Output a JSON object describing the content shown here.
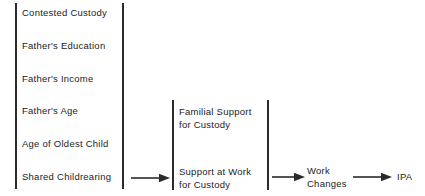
{
  "diagram": {
    "type": "flow-diagram",
    "line_color": "#2b2b2b",
    "text_color": "#1b1b1b",
    "background": "#ffffff",
    "columns": [
      {
        "id": "predictors",
        "name": "predictor-variables-bracket",
        "bracket": {
          "left_x": 15,
          "right_x": 122,
          "top_y": 3,
          "bottom_y": 189
        },
        "items": [
          {
            "label": "Contested Custody",
            "x": 22,
            "y": 7
          },
          {
            "label": "Father's Education",
            "x": 22,
            "y": 40
          },
          {
            "label": "Father's Income",
            "x": 22,
            "y": 73
          },
          {
            "label": "Father's Age",
            "x": 22,
            "y": 105
          },
          {
            "label": "Age of Oldest Child",
            "x": 22,
            "y": 138
          },
          {
            "label": "Shared Childrearing",
            "x": 22,
            "y": 171
          }
        ]
      },
      {
        "id": "support",
        "name": "support-variables-bracket",
        "bracket": {
          "left_x": 172,
          "right_x": 267,
          "top_y": 100,
          "bottom_y": 190
        },
        "items": [
          {
            "lines": [
              "Familial  Support",
              "for Custody"
            ],
            "x": 179,
            "y": 106
          },
          {
            "lines": [
              "Support  at  Work",
              "for Custody"
            ],
            "x": 179,
            "y": 166
          }
        ]
      },
      {
        "id": "mediator",
        "name": "work-changes-node",
        "items": [
          {
            "lines": [
              "Work",
              "Changes"
            ],
            "x": 307,
            "y": 165
          }
        ]
      },
      {
        "id": "outcome",
        "name": "ipa-outcome-node",
        "items": [
          {
            "label": "IPA",
            "x": 397,
            "y": 171
          }
        ]
      }
    ],
    "arrows": [
      {
        "name": "arrow-predictors-to-support",
        "x1": 131,
        "x2": 169,
        "y": 178
      },
      {
        "name": "arrow-support-to-work-changes",
        "x1": 272,
        "x2": 304,
        "y": 177
      },
      {
        "name": "arrow-work-changes-to-ipa",
        "x1": 353,
        "x2": 391,
        "y": 177
      }
    ]
  }
}
